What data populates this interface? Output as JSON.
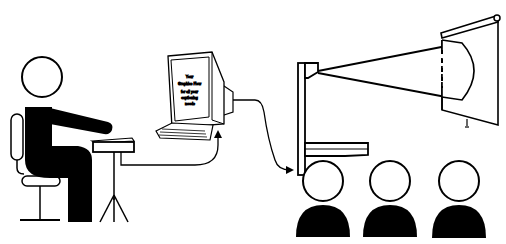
{
  "diagram": {
    "colors": {
      "ink": "#000000",
      "background": "#ffffff"
    },
    "nodes": [
      {
        "id": "captioner",
        "label": "Seated captioner on chair"
      },
      {
        "id": "stenotype",
        "label": "Stenotype machine on tripod"
      },
      {
        "id": "computer",
        "label": "Computer with monitor and keyboard"
      },
      {
        "id": "projector",
        "label": "Overhead projector"
      },
      {
        "id": "screen",
        "label": "Projection screen"
      },
      {
        "id": "audience",
        "label": "Audience (3 people)"
      }
    ],
    "edges": [
      {
        "from": "stenotype",
        "to": "computer",
        "type": "cable-arrow"
      },
      {
        "from": "computer",
        "to": "projector",
        "type": "cable-arrow"
      },
      {
        "from": "projector",
        "to": "screen",
        "type": "light-beam"
      }
    ],
    "monitor_text": {
      "line1": "Your",
      "line2": "Graphics Flow",
      "line3": "for all your",
      "line4": "captioning",
      "line5": "needs"
    }
  }
}
